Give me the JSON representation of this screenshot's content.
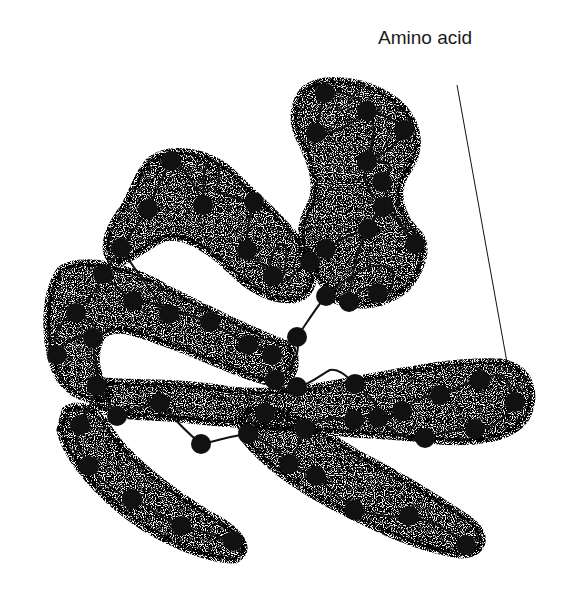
{
  "diagram": {
    "type": "protein tertiary structure illustration",
    "labels": [
      {
        "id": "amino-acid",
        "text": "Amino acid",
        "x": 378,
        "y": 45,
        "leader": {
          "x1": 457,
          "y1": 85,
          "x2": 508,
          "y2": 368
        }
      }
    ],
    "colors": {
      "ink": "#111111",
      "background": "#ffffff"
    },
    "envelope_paths": [
      "M 300 95 C 310 75, 360 75, 395 100 C 420 120, 425 150, 405 175 C 395 195, 400 215, 420 235 C 430 250, 420 275, 405 290 C 385 305, 360 310, 335 300 L 320 280 C 300 260, 295 230, 310 205 C 320 185, 310 160, 300 140 C 292 125, 292 108, 300 95 Z",
      "M 150 160 C 170 145, 210 150, 235 175 C 260 200, 290 225, 310 255 C 320 280, 310 300, 290 300 C 270 300, 250 290, 230 270 C 210 250, 180 230, 160 240 C 140 250, 120 270, 110 260 C 100 245, 110 225, 125 205 C 135 185, 140 170, 150 160 Z",
      "M 60 270 C 80 255, 130 265, 170 290 C 210 310, 250 330, 290 345 C 300 360, 295 380, 280 385 C 250 380, 210 360, 170 345 C 140 335, 110 320, 100 340 C 92 360, 98 380, 110 395 C 100 405, 75 400, 60 380 C 45 355, 40 300, 60 270 Z",
      "M 95 380 C 130 385, 180 380, 230 390 C 280 395, 330 385, 380 375 C 420 368, 460 360, 500 362 C 530 365, 540 395, 525 420 C 510 440, 470 445, 430 440 C 390 435, 350 435, 310 430 C 270 425, 230 425, 190 420 C 150 415, 110 420, 95 405 Z",
      "M 65 410 C 80 400, 100 410, 110 430 C 130 460, 170 490, 210 515 C 240 530, 255 550, 235 560 C 200 560, 150 535, 120 510 C 90 485, 65 455, 60 430 Z",
      "M 250 410 C 280 405, 320 430, 360 455 C 400 475, 440 500, 470 520 C 490 535, 485 555, 460 555 C 420 550, 380 530, 340 510 C 300 490, 265 465, 245 440 C 238 425, 240 415, 250 410 Z"
    ],
    "chain_path": "M 233 541 C 210 535, 195 528, 181 526 C 165 522, 150 505, 132 499 C 115 493, 100 480, 89 466 C 80 450, 72 438, 80 425 C 88 410, 95 395, 97 386 C 100 370, 92 355, 93 338 C 85 330, 65 340, 57 355 C 50 335, 60 320, 76 313 C 90 300, 100 285, 103 274 C 110 262, 118 255, 121 248 C 130 235, 140 222, 148 209 C 155 195, 162 175, 171 161 C 185 165, 195 185, 203 205 C 205 190, 200 170, 210 160 C 222 160, 220 180, 215 190 C 225 195, 240 200, 254 202 C 250 215, 245 235, 247 250 C 255 262, 270 268, 273 276 C 265 265, 275 240, 285 245 C 290 255, 280 285, 282 283 C 295 275, 305 260, 310 262 C 315 250, 320 245, 326 249 C 340 240, 355 232, 368 229 C 375 215, 380 205, 383 207 C 395 215, 405 232, 415 244 C 405 230, 390 210, 382 182 C 390 170, 400 160, 367 161 C 370 150, 380 125, 367 111 C 355 120, 340 135, 316 133 C 320 115, 322 100, 325 93 C 340 90, 360 95, 367 111 C 380 112, 395 120, 404 130 C 395 150, 380 155, 368 160 C 360 175, 365 190, 383 207 C 375 220, 355 235, 349 302 C 360 290, 370 280, 378 293 C 390 300, 395 285, 392 270 C 380 260, 360 265, 326 296 C 318 305, 310 318, 297 337 C 300 350, 298 365, 275 380 C 280 390, 290 395, 297 387 C 310 385, 320 375, 330 370 C 340 368, 350 380, 355 384 C 370 395, 380 405, 378 418 C 390 420, 400 412, 402 411 C 415 400, 425 395, 440 395 C 455 390, 470 380, 480 380 C 495 375, 505 365, 515 402 C 505 420, 490 428, 475 429 C 460 430, 440 432, 425 438 C 410 442, 395 435, 380 420 C 365 410, 355 420, 354 420 C 340 418, 325 415, 305 429 C 300 440, 295 455, 288 464 C 300 470, 310 475, 316 476 C 330 490, 345 500, 354 510 C 375 515, 395 518, 409 516 C 430 520, 450 530, 466 545",
    "chain_path_secondary": [
      "M 76 313 C 90 320, 100 325, 93 338",
      "M 103 274 C 115 285, 125 295, 133 301",
      "M 133 301 C 150 300, 160 305, 169 314 C 180 310, 190 315, 210 322 C 225 330, 240 340, 248 345 C 255 345, 265 348, 272 355",
      "M 121 248 C 135 270, 150 290, 169 314",
      "M 97 386 C 105 395, 110 405, 117 416 C 130 410, 145 405, 160 403 C 175 420, 190 435, 201 444 C 220 440, 235 435, 248 434 C 255 425, 262 418, 265 413",
      "M 248 434 C 260 440, 275 445, 289 464",
      "M 275 380 C 268 395, 262 405, 265 413 C 275 420, 290 425, 305 429"
    ],
    "amino_acids": [
      [
        325,
        93
      ],
      [
        367,
        111
      ],
      [
        404,
        130
      ],
      [
        316,
        133
      ],
      [
        367,
        161
      ],
      [
        382,
        182
      ],
      [
        383,
        207
      ],
      [
        415,
        244
      ],
      [
        368,
        229
      ],
      [
        326,
        249
      ],
      [
        310,
        262
      ],
      [
        349,
        302
      ],
      [
        378,
        293
      ],
      [
        326,
        296
      ],
      [
        297,
        337
      ],
      [
        272,
        355
      ],
      [
        171,
        161
      ],
      [
        203,
        205
      ],
      [
        254,
        202
      ],
      [
        148,
        209
      ],
      [
        247,
        250
      ],
      [
        273,
        276
      ],
      [
        121,
        248
      ],
      [
        103,
        274
      ],
      [
        133,
        301
      ],
      [
        76,
        313
      ],
      [
        93,
        338
      ],
      [
        57,
        355
      ],
      [
        169,
        314
      ],
      [
        210,
        322
      ],
      [
        248,
        345
      ],
      [
        275,
        380
      ],
      [
        297,
        387
      ],
      [
        355,
        384
      ],
      [
        378,
        418
      ],
      [
        402,
        411
      ],
      [
        440,
        395
      ],
      [
        480,
        380
      ],
      [
        515,
        402
      ],
      [
        475,
        429
      ],
      [
        425,
        438
      ],
      [
        354,
        420
      ],
      [
        97,
        386
      ],
      [
        117,
        416
      ],
      [
        160,
        403
      ],
      [
        201,
        444
      ],
      [
        248,
        434
      ],
      [
        265,
        413
      ],
      [
        305,
        429
      ],
      [
        289,
        464
      ],
      [
        316,
        476
      ],
      [
        80,
        425
      ],
      [
        89,
        466
      ],
      [
        132,
        499
      ],
      [
        181,
        526
      ],
      [
        233,
        541
      ],
      [
        354,
        510
      ],
      [
        409,
        516
      ],
      [
        466,
        545
      ]
    ],
    "amino_acid_radius": 10
  }
}
